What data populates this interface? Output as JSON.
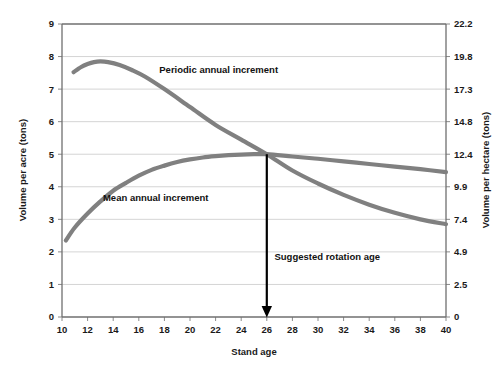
{
  "chart_data": {
    "type": "line",
    "title": "",
    "xlabel": "Stand age",
    "ylabel": "Volume per acre (tons)",
    "ylabel_secondary": "Volume per hectare (tons)",
    "xlim": [
      10,
      40
    ],
    "ylim": [
      0,
      9
    ],
    "ylim_secondary": [
      0,
      22.2
    ],
    "grid": true,
    "legend_position": "inline-annotations",
    "x_ticks": [
      10,
      12,
      14,
      16,
      18,
      20,
      22,
      24,
      26,
      28,
      30,
      32,
      34,
      36,
      38,
      40
    ],
    "y_ticks": [
      0,
      1,
      2,
      3,
      4,
      5,
      6,
      7,
      8,
      9
    ],
    "y_ticks_secondary": [
      0,
      2.5,
      4.9,
      7.4,
      9.9,
      12.4,
      14.8,
      17.3,
      19.8,
      22.2
    ],
    "series": [
      {
        "name": "Periodic annual increment",
        "color": "#808080",
        "x": [
          10.9,
          11.5,
          12.0,
          12.5,
          13.0,
          13.6,
          14.5,
          15.5,
          16.5,
          18.0,
          20.0,
          22.0,
          24.0,
          26.0,
          28.0,
          30.0,
          32.0,
          34.0,
          36.0,
          38.0,
          40.0
        ],
        "values": [
          7.52,
          7.68,
          7.77,
          7.83,
          7.85,
          7.83,
          7.74,
          7.58,
          7.38,
          7.0,
          6.45,
          5.9,
          5.45,
          5.0,
          4.5,
          4.1,
          3.75,
          3.45,
          3.2,
          3.0,
          2.85
        ]
      },
      {
        "name": "Mean annual increment",
        "color": "#808080",
        "x": [
          10.3,
          11.0,
          12.0,
          13.0,
          14.0,
          15.0,
          16.0,
          17.0,
          18.0,
          19.0,
          20.0,
          21.0,
          22.0,
          23.0,
          24.0,
          25.0,
          26.0,
          28.0,
          30.0,
          32.0,
          34.0,
          36.0,
          38.0,
          40.0
        ],
        "values": [
          2.35,
          2.75,
          3.18,
          3.55,
          3.88,
          4.12,
          4.34,
          4.52,
          4.65,
          4.76,
          4.84,
          4.9,
          4.94,
          4.97,
          4.99,
          5.0,
          5.0,
          4.93,
          4.86,
          4.78,
          4.7,
          4.62,
          4.54,
          4.45
        ]
      }
    ],
    "annotations": [
      {
        "text": "Periodic annual increment",
        "x": 17.6,
        "y": 7.5,
        "name": "periodic-annual-increment-label"
      },
      {
        "text": "Mean annual increment",
        "x": 13.2,
        "y": 3.55,
        "name": "mean-annual-increment-label"
      },
      {
        "text": "Suggested rotation age",
        "x": 26.6,
        "y": 1.75,
        "name": "suggested-rotation-age-label"
      }
    ],
    "markers": [
      {
        "name": "rotation-age-arrow",
        "type": "vertical-arrow",
        "x": 26,
        "y_start": 5.0,
        "y_end": 0.0,
        "color": "#000000"
      }
    ]
  },
  "axis": {
    "x_title": "Stand age",
    "y_left_title": "Volume per acre (tons)",
    "y_right_title": "Volume per hectare (tons)"
  }
}
